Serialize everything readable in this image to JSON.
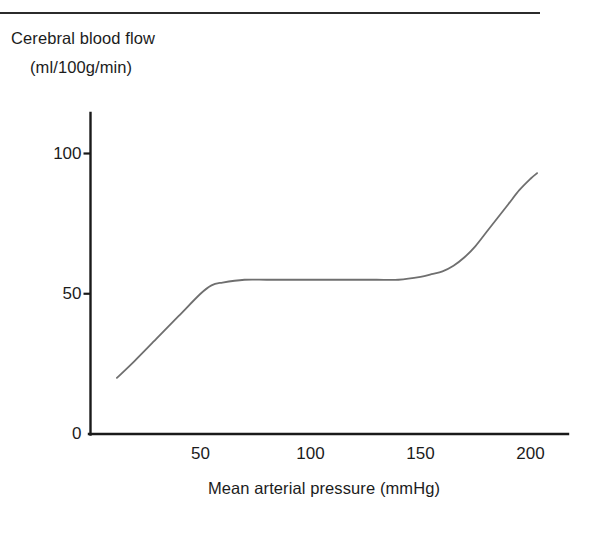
{
  "figure": {
    "top_rule": true,
    "y_axis_title_line1": "Cerebral blood flow",
    "y_axis_title_line2": "(ml/100g/min)",
    "x_axis_title": "Mean arterial pressure (mmHg)",
    "curve_color": "#6f6f6f",
    "axis_color": "#1a1a1a",
    "text_color": "#1c1c1c"
  },
  "chart_data": {
    "type": "line",
    "title": "",
    "subtitle": "",
    "xlabel": "Mean arterial pressure (mmHg)",
    "ylabel": "Cerebral blood flow (ml/100g/min)",
    "xlim": [
      0,
      217
    ],
    "ylim": [
      0,
      115
    ],
    "xticks": [
      50,
      100,
      150,
      200
    ],
    "xtick_labels": [
      "50",
      "100",
      "150",
      "200"
    ],
    "yticks": [
      0,
      50,
      100
    ],
    "ytick_labels": [
      "0",
      "50",
      "100"
    ],
    "grid": false,
    "legend": null,
    "series": [
      {
        "name": "Cerebral blood flow autoregulation curve",
        "color": "#6f6f6f",
        "x": [
          12,
          20,
          30,
          40,
          50,
          55,
          60,
          70,
          80,
          90,
          100,
          110,
          120,
          130,
          140,
          150,
          155,
          160,
          165,
          170,
          175,
          180,
          185,
          190,
          195,
          200,
          203
        ],
        "y": [
          20,
          26,
          34,
          42,
          50,
          53,
          54,
          55,
          55,
          55,
          55,
          55,
          55,
          55,
          55,
          56,
          57,
          58,
          60,
          63,
          67,
          72,
          77,
          82,
          87,
          91,
          93
        ]
      }
    ],
    "annotations": []
  },
  "ticks": {
    "y": [
      {
        "label": "100",
        "value": 100
      },
      {
        "label": "50",
        "value": 50
      },
      {
        "label": "0",
        "value": 0
      }
    ],
    "x": [
      {
        "label": "50",
        "value": 50
      },
      {
        "label": "100",
        "value": 100
      },
      {
        "label": "150",
        "value": 150
      },
      {
        "label": "200",
        "value": 200
      }
    ]
  }
}
